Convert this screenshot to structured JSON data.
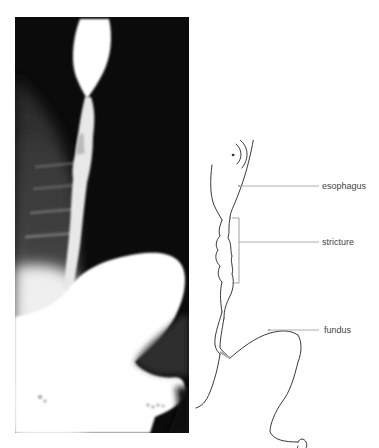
{
  "figure": {
    "xray_panel": {
      "description": "barium swallow radiograph",
      "background_color": "#0a0a0a",
      "contrast_color": "#ffffff"
    },
    "diagram_panel": {
      "line_color": "#222222",
      "leader_color": "#9a9a9a",
      "labels": [
        {
          "id": "esophagus",
          "text": "esophagus"
        },
        {
          "id": "stricture",
          "text": "stricture"
        },
        {
          "id": "fundus",
          "text": "fundus"
        }
      ]
    }
  }
}
